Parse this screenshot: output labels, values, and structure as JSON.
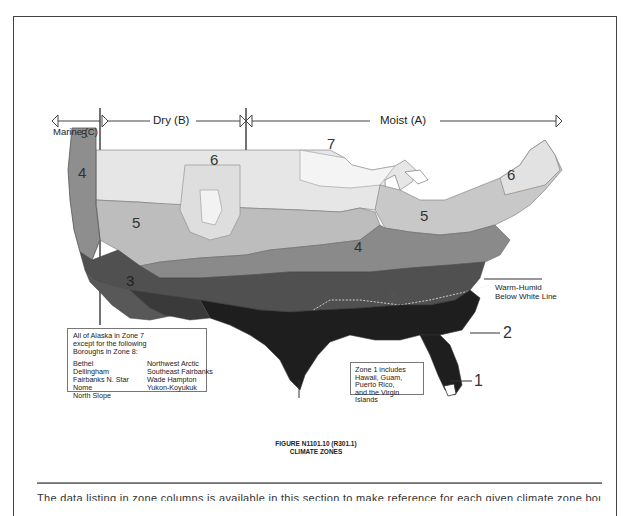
{
  "figure": {
    "title_line1": "FIGURE N1101.10 (R301.1)",
    "title_line2": "CLIMATE ZONES"
  },
  "moisture_regimes": {
    "marine": "Marine (C)",
    "dry": "Dry (B)",
    "moist": "Moist (A)"
  },
  "zones": [
    {
      "id": "1",
      "label": "1",
      "color": "#ffffff"
    },
    {
      "id": "2",
      "label": "2",
      "color": "#1e1e1e"
    },
    {
      "id": "3",
      "label": "3",
      "color": "#4a4a4a"
    },
    {
      "id": "4",
      "label": "4",
      "color": "#7a7a7a"
    },
    {
      "id": "5",
      "label": "5",
      "color": "#b4b4b4"
    },
    {
      "id": "6",
      "label": "6",
      "color": "#d8d8d8"
    },
    {
      "id": "7",
      "label": "7",
      "color": "#f2f2f2"
    }
  ],
  "zone_labels_on_map": {
    "marine_4": "4",
    "marine_5": "5",
    "west_5": "5",
    "west_6": "6",
    "north_7": "7",
    "east_5": "5",
    "east_6": "6",
    "central_4": "4",
    "southeast_3": "3",
    "southwest_3": "3",
    "callout_2": "2",
    "callout_1": "1"
  },
  "annotations": {
    "warm_humid_line1": "Warm-Humid",
    "warm_humid_line2": "Below White Line"
  },
  "alaska_box": {
    "header_line1": "All of Alaska in Zone 7",
    "header_line2": "except for the following",
    "header_line3": "Boroughs in Zone 8:",
    "col1": [
      "Bethel",
      "Dellingham",
      "Fairbanks N. Star",
      "Nome",
      "North Slope"
    ],
    "col2": [
      "Northwest Arctic",
      "Southeast Fairbanks",
      "Wade Hampton",
      "Yukon-Koyukuk"
    ]
  },
  "zone1_box": {
    "line1": "Zone 1 includes",
    "line2": "Hawaii, Guam,",
    "line3": "Puerto Rico,",
    "line4": "and the Virgin Islands"
  },
  "bottom_text": "The data listing in zone columns is available in this section to make reference for each given climate zone boundary in the code"
}
